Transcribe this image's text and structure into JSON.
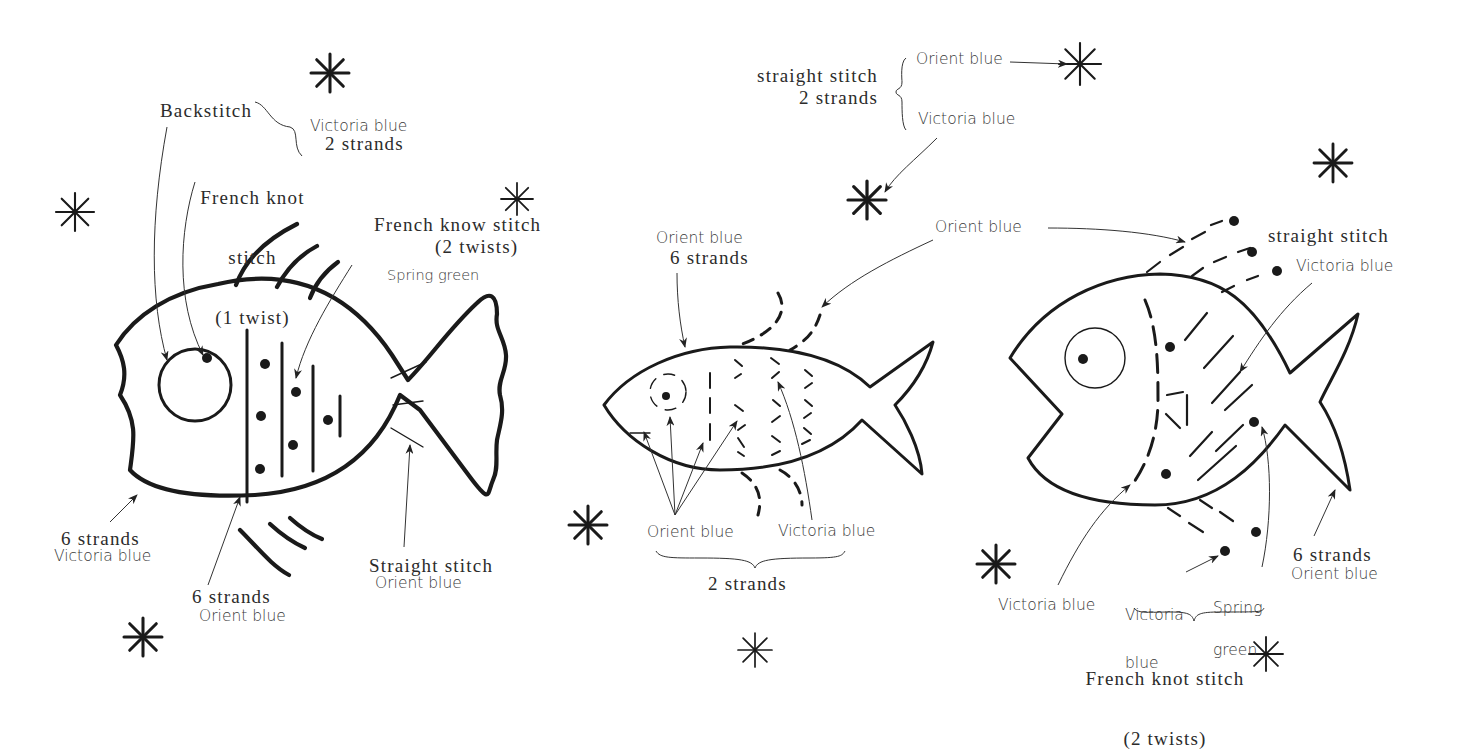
{
  "diagram": {
    "type": "embroidery-stitch-pattern",
    "ink_color": "#1a1a1a",
    "background": "#ffffff",
    "fish_left": {
      "labels": {
        "backstitch": "Backstitch",
        "french_knot_1": "French knot",
        "french_knot_2": "stitch",
        "french_knot_3": "(1 twist)",
        "bracket_color": "Victoria blue",
        "bracket_strands": "2 strands",
        "french_know_1": "French know stitch",
        "french_know_2": "(2 twists)",
        "spring_green": "Spring green",
        "outline_strands": "6 strands",
        "outline_color": "Victoria blue",
        "stripes_strands": "6 strands",
        "stripes_color": "Orient blue",
        "tail_stitch": "Straight stitch",
        "tail_color": "Orient blue"
      }
    },
    "fish_middle": {
      "labels": {
        "top_stitch_1": "straight stitch",
        "top_stitch_2": "2 strands",
        "top_orient": "Orient blue",
        "top_victoria": "Victoria blue",
        "outline_color": "Orient blue",
        "outline_strands": "6 strands",
        "bubbles_color": "Orient blue",
        "bottom_orient": "Orient blue",
        "bottom_victoria": "Victoria blue",
        "bottom_strands": "2 strands"
      }
    },
    "fish_right": {
      "labels": {
        "straight_stitch": "straight stitch",
        "victoria_top": "Victoria blue",
        "victoria_left": "Victoria blue",
        "victoria_knot_1": "Victoria",
        "victoria_knot_2": "blue",
        "spring_1": "Spring",
        "spring_2": "green",
        "outline_strands": "6 strands",
        "outline_color": "Orient blue",
        "knot_stitch_1": "French knot stitch",
        "knot_stitch_2": "(2 twists)"
      }
    },
    "asterisk_count": 11
  }
}
